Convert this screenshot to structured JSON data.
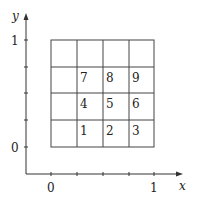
{
  "diagram": {
    "type": "unit-square-grid",
    "x_axis": {
      "label": "x",
      "ticks": [
        "0",
        "1"
      ]
    },
    "y_axis": {
      "label": "y",
      "ticks": [
        "0",
        "1"
      ]
    },
    "grid": {
      "rows": 4,
      "cols": 4
    },
    "cells": [
      {
        "row": 1,
        "col": 1,
        "label": "7"
      },
      {
        "row": 1,
        "col": 2,
        "label": "8"
      },
      {
        "row": 1,
        "col": 3,
        "label": "9"
      },
      {
        "row": 2,
        "col": 1,
        "label": "4"
      },
      {
        "row": 2,
        "col": 2,
        "label": "5"
      },
      {
        "row": 2,
        "col": 3,
        "label": "6"
      },
      {
        "row": 3,
        "col": 1,
        "label": "1"
      },
      {
        "row": 3,
        "col": 2,
        "label": "2"
      },
      {
        "row": 3,
        "col": 3,
        "label": "3"
      }
    ],
    "colors": {
      "line": "#444444",
      "axis": "#333333"
    }
  }
}
